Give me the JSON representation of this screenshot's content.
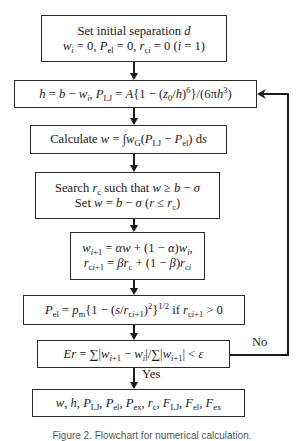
{
  "flowchart": {
    "steps": [
      {
        "id": "init",
        "lines": [
          "Set initial separation d",
          "w_i = 0, P_el = 0, r_ci = 0 (i = 1)"
        ]
      },
      {
        "id": "lj-pressure",
        "lines": [
          "h = b − w_i, P_LJ = A{1 − (z0/h)^6}/(6πh^3)"
        ]
      },
      {
        "id": "calc-w",
        "lines": [
          "Calculate w = ∫w_G(P_LJ − P_el) ds"
        ]
      },
      {
        "id": "search-rc",
        "lines": [
          "Search r_c such that w ≥ b − σ",
          "Set w = b − σ (r ≤ r_c)"
        ]
      },
      {
        "id": "update",
        "lines": [
          "w_i+1 = αw + (1 − α)w_i,",
          "r_ci+1 = βr_c + (1 − β)r_ci"
        ]
      },
      {
        "id": "p-el",
        "lines": [
          "P_el = p_m{1 − (s/r_ci+1)^2}^1/2 if r_ci+1 > 0"
        ]
      },
      {
        "id": "convergence",
        "lines": [
          "Er = ∑|w_i+1 − w_i|/∑|w_i+1| < ε"
        ]
      },
      {
        "id": "output",
        "lines": [
          "w, h, P_LJ, P_el, P_ex, r_c, F_LJ, F_el, F_ex"
        ]
      }
    ],
    "labels": {
      "no": "No",
      "yes": "Yes"
    },
    "caption": "Figure 2. Flowchart for numerical calculation."
  }
}
